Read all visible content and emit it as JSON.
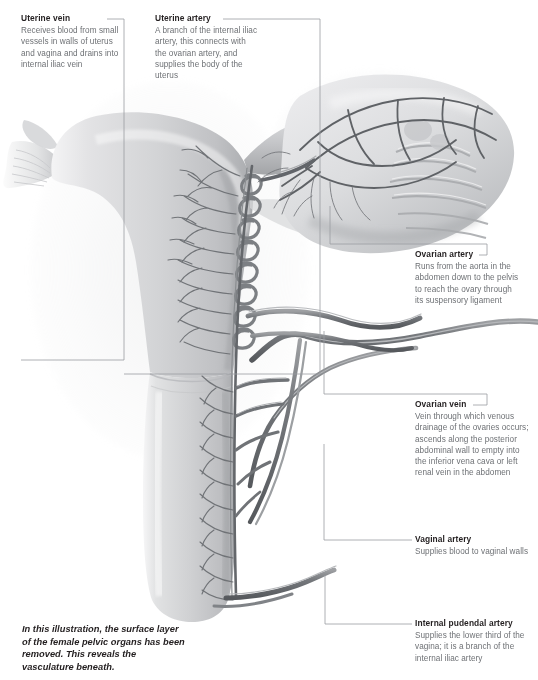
{
  "figure": {
    "caption": "In this illustration, the surface layer of the female pelvic organs has been removed. This reveals the vasculature beneath."
  },
  "palette": {
    "label_title": "#231f20",
    "label_body": "#6e7175",
    "leader_line": "#9a9da1",
    "organ_light": "#e9e9ea",
    "organ_mid": "#c9cacc",
    "organ_dark": "#8f9194",
    "vessel": "#6f7276",
    "vessel_dark": "#4f5255",
    "background": "#ffffff"
  },
  "labels": [
    {
      "id": "uterine-vein",
      "title": "Uterine vein",
      "body": "Receives blood from small vessels in walls of uterus and vagina and drains into internal iliac vein"
    },
    {
      "id": "uterine-artery",
      "title": "Uterine artery",
      "body": "A branch of the internal iliac artery, this connects with the ovarian artery, and supplies the body of the uterus"
    },
    {
      "id": "ovarian-artery",
      "title": "Ovarian artery",
      "body": "Runs from the aorta in the abdomen down to the pelvis to reach the ovary through its suspensory ligament"
    },
    {
      "id": "ovarian-vein",
      "title": "Ovarian vein",
      "body": "Vein through which venous drainage of the ovaries occurs; ascends along the posterior abdominal wall to empty into the inferior vena cava or left renal vein in the abdomen"
    },
    {
      "id": "vaginal-artery",
      "title": "Vaginal artery",
      "body": "Supplies blood to vaginal walls"
    },
    {
      "id": "internal-pudendal-artery",
      "title": "Internal pudendal artery",
      "body": "Supplies the lower third of the vagina; it is a branch of the internal iliac artery"
    }
  ],
  "anatomy": {
    "structures": [
      "uterus-body",
      "uterine-fundus",
      "fallopian-tube",
      "fimbriae",
      "ovary",
      "cervix",
      "vagina",
      "broad-ligament",
      "arcuate-vessels",
      "spiral-vessels"
    ]
  }
}
